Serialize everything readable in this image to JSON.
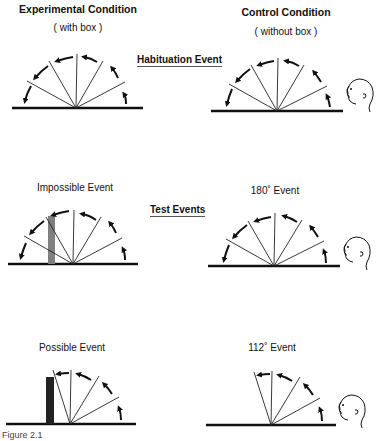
{
  "columns": {
    "experimental": {
      "title": "Experimental Condition",
      "subtitle": "( with box )"
    },
    "control": {
      "title": "Control Condition",
      "subtitle": "( without box )"
    }
  },
  "rows": {
    "habituation": {
      "label": "Habituation Event"
    },
    "test": {
      "label": "Test Events"
    }
  },
  "events": {
    "impossible": {
      "label": "Impossible Event"
    },
    "possible": {
      "label": "Possible Event"
    },
    "deg180": {
      "label": "180˚ Event"
    },
    "deg112": {
      "label": "112˚ Event"
    }
  },
  "caption": "Figure 2.1"
}
